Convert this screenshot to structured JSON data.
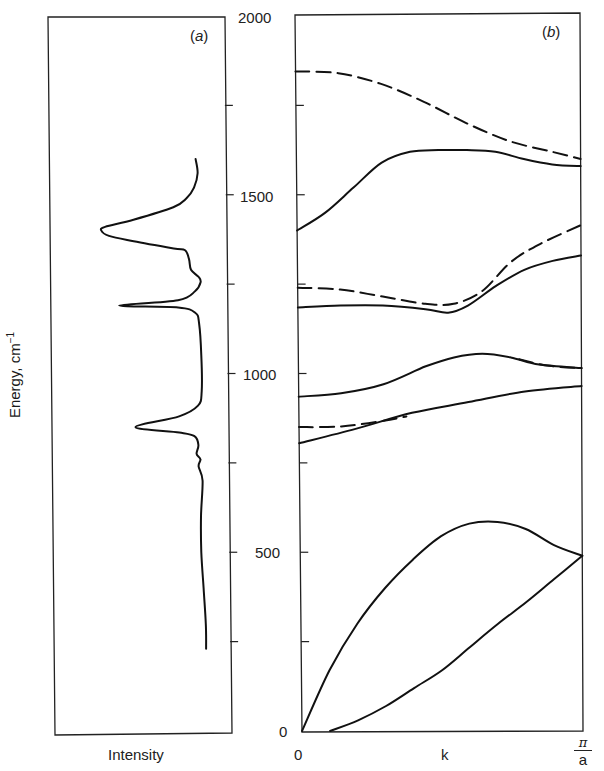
{
  "figure": {
    "panel_a_tag": "a",
    "panel_b_tag": "b",
    "y_axis_label": "Energy, cm",
    "y_axis_label_sup": "−1",
    "x_axis_label_a": "Intensity",
    "x_axis_label_b": "k",
    "x_tick_start": "0",
    "x_tick_end_num": "π",
    "x_tick_end_den": "a",
    "y_ticks": [
      "2000",
      "1500",
      "1000",
      "500",
      "0"
    ]
  },
  "chart_data": [
    {
      "panel": "a",
      "type": "line",
      "title": "(a)",
      "xlabel": "Intensity",
      "ylabel": "Energy, cm^-1",
      "ylim": [
        0,
        2000
      ],
      "orientation": "vertical spectrum (energy on y, intensity on x, increasing to the left)",
      "grid": false,
      "y_tick_marks": [
        250,
        750,
        1250,
        1750
      ],
      "peaks": [
        {
          "energy": 1400,
          "relative_intensity": 0.62,
          "shape": "broad"
        },
        {
          "energy": 1190,
          "relative_intensity": 0.53,
          "shape": "sharp"
        },
        {
          "energy": 850,
          "relative_intensity": 0.45,
          "shape": "sharp"
        }
      ],
      "spectrum_range": [
        230,
        1600
      ],
      "points": [
        [
          0.12,
          1600
        ],
        [
          0.11,
          1560
        ],
        [
          0.13,
          1520
        ],
        [
          0.17,
          1490
        ],
        [
          0.24,
          1465
        ],
        [
          0.45,
          1430
        ],
        [
          0.6,
          1410
        ],
        [
          0.62,
          1400
        ],
        [
          0.58,
          1385
        ],
        [
          0.45,
          1370
        ],
        [
          0.24,
          1350
        ],
        [
          0.18,
          1345
        ],
        [
          0.16,
          1320
        ],
        [
          0.15,
          1290
        ],
        [
          0.11,
          1270
        ],
        [
          0.1,
          1255
        ],
        [
          0.13,
          1230
        ],
        [
          0.22,
          1205
        ],
        [
          0.53,
          1190
        ],
        [
          0.22,
          1185
        ],
        [
          0.13,
          1170
        ],
        [
          0.11,
          1140
        ],
        [
          0.1,
          1050
        ],
        [
          0.1,
          950
        ],
        [
          0.12,
          910
        ],
        [
          0.22,
          880
        ],
        [
          0.45,
          850
        ],
        [
          0.22,
          835
        ],
        [
          0.14,
          825
        ],
        [
          0.12,
          800
        ],
        [
          0.13,
          775
        ],
        [
          0.11,
          760
        ],
        [
          0.12,
          740
        ],
        [
          0.1,
          700
        ],
        [
          0.11,
          600
        ],
        [
          0.11,
          500
        ],
        [
          0.1,
          400
        ],
        [
          0.09,
          300
        ],
        [
          0.09,
          230
        ]
      ]
    },
    {
      "panel": "b",
      "type": "line",
      "title": "(b)",
      "xlabel": "k",
      "ylabel": "Energy, cm^-1",
      "xlim": [
        0,
        1
      ],
      "x_tick_labels": [
        "0",
        "π/a"
      ],
      "ylim": [
        0,
        2000
      ],
      "y_tick_labels": [
        "0",
        "500",
        "1000",
        "1500",
        "2000"
      ],
      "y_tick_marks": [
        250,
        750,
        1250,
        1750
      ],
      "grid": false,
      "series": [
        {
          "name": "dashed band 1 (upper)",
          "style": "dashed",
          "x": [
            0,
            0.15,
            0.3,
            0.45,
            0.6,
            0.75,
            0.9,
            1.0
          ],
          "y": [
            1845,
            1840,
            1810,
            1760,
            1700,
            1650,
            1620,
            1600
          ]
        },
        {
          "name": "solid band 1",
          "style": "solid",
          "x": [
            0,
            0.1,
            0.2,
            0.3,
            0.4,
            0.5,
            0.6,
            0.7,
            0.8,
            0.9,
            1.0
          ],
          "y": [
            1400,
            1450,
            1520,
            1590,
            1620,
            1625,
            1625,
            1620,
            1600,
            1585,
            1580
          ]
        },
        {
          "name": "dashed band 2",
          "style": "dashed",
          "x": [
            0,
            0.15,
            0.3,
            0.45,
            0.55,
            0.65,
            0.75,
            0.85,
            1.0
          ],
          "y": [
            1240,
            1235,
            1215,
            1195,
            1195,
            1230,
            1310,
            1360,
            1415
          ]
        },
        {
          "name": "solid band 2",
          "style": "solid",
          "x": [
            0,
            0.15,
            0.3,
            0.45,
            0.53,
            0.6,
            0.7,
            0.8,
            0.9,
            1.0
          ],
          "y": [
            1185,
            1190,
            1190,
            1180,
            1170,
            1190,
            1245,
            1290,
            1315,
            1330
          ]
        },
        {
          "name": "solid band 3",
          "style": "solid",
          "x": [
            0,
            0.15,
            0.3,
            0.45,
            0.55,
            0.65,
            0.75,
            0.85,
            1.0
          ],
          "y": [
            935,
            945,
            970,
            1020,
            1045,
            1055,
            1045,
            1025,
            1015
          ]
        },
        {
          "name": "dashed band 3 (upper right)",
          "style": "dashed",
          "x": [
            0.78,
            0.88,
            1.0
          ],
          "y": [
            1040,
            1022,
            1015
          ]
        },
        {
          "name": "dashed band 4 (lower left)",
          "style": "dashed",
          "x": [
            0,
            0.15,
            0.3,
            0.38
          ],
          "y": [
            850,
            852,
            868,
            880
          ]
        },
        {
          "name": "solid band 4",
          "style": "solid",
          "x": [
            0,
            0.2,
            0.4,
            0.6,
            0.8,
            1.0
          ],
          "y": [
            805,
            845,
            890,
            920,
            950,
            965
          ]
        },
        {
          "name": "acoustic upper",
          "style": "solid",
          "x": [
            0,
            0.1,
            0.2,
            0.3,
            0.4,
            0.5,
            0.6,
            0.7,
            0.8,
            0.9,
            1.0
          ],
          "y": [
            0,
            170,
            300,
            400,
            480,
            545,
            580,
            585,
            565,
            520,
            490
          ]
        },
        {
          "name": "acoustic lower",
          "style": "solid",
          "x": [
            0.1,
            0.2,
            0.3,
            0.4,
            0.5,
            0.6,
            0.7,
            0.8,
            0.9,
            1.0
          ],
          "y": [
            0,
            30,
            70,
            120,
            170,
            235,
            300,
            360,
            425,
            490
          ]
        }
      ]
    }
  ]
}
